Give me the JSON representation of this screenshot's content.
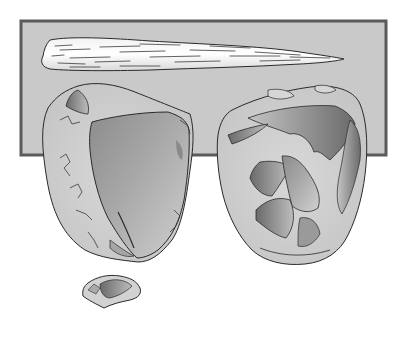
{
  "illustration": {
    "subject": "Prehistoric stone tools",
    "items": [
      {
        "name": "wooden spear point"
      },
      {
        "name": "hand axe (front view)"
      },
      {
        "name": "hand axe (reverse view)"
      },
      {
        "name": "small flake"
      }
    ]
  },
  "colors": {
    "background": "#ffffff",
    "panel_fill": "#c9c9c9",
    "panel_border": "#5a5a5a",
    "outline": "#2a2a2a",
    "stone_light": "#d4d4d4",
    "stone_dark": "#6e6e6e",
    "spear_fill": "#ebebeb"
  }
}
